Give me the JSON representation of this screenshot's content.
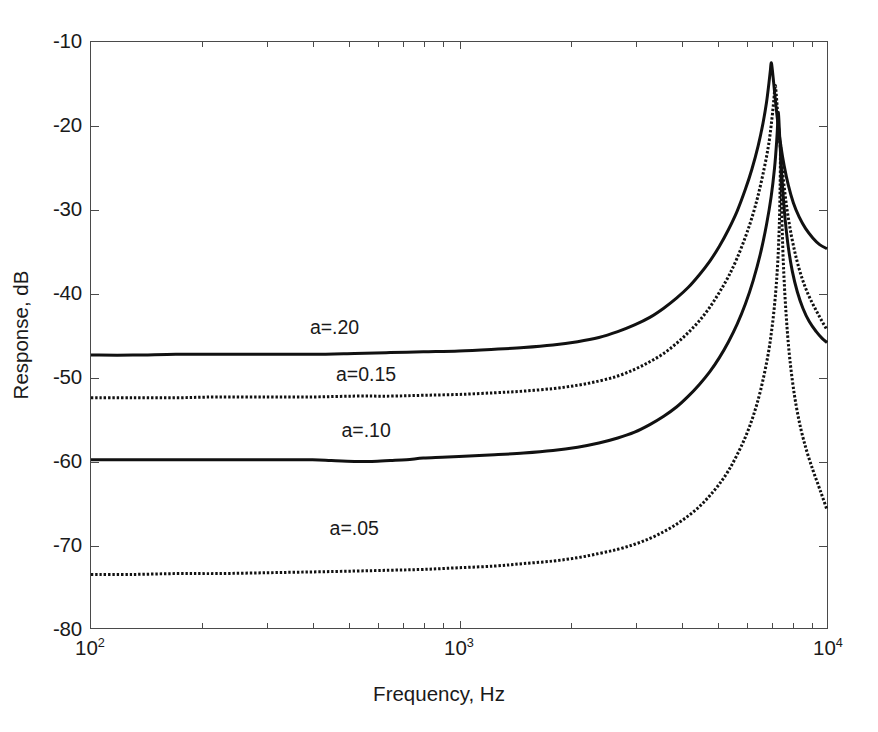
{
  "chart_data": {
    "type": "line",
    "title": "",
    "xlabel": "Frequency, Hz",
    "ylabel": "Response, dB",
    "xscale": "log",
    "yscale": "linear",
    "xlim": [
      100,
      10000
    ],
    "ylim": [
      -80,
      -10
    ],
    "grid": false,
    "legend_position": "inline-annotations",
    "xticks": [
      {
        "value": 100,
        "label": "10",
        "exponent": "2"
      },
      {
        "value": 1000,
        "label": "10",
        "exponent": "3"
      },
      {
        "value": 10000,
        "label": "10",
        "exponent": "4"
      }
    ],
    "yticks": [
      -10,
      -20,
      -30,
      -40,
      -50,
      -60,
      -70,
      -80
    ],
    "ytick_labels": [
      "-10",
      "-20",
      "-30",
      "-40",
      "-50",
      "-60",
      "-70",
      "-80"
    ],
    "series": [
      {
        "name": "a=.20",
        "annotation": "a=.20",
        "annotation_x": 460,
        "annotation_y": -44.0,
        "style": "solid",
        "color": "#111111",
        "width": 3.0,
        "baseline_db": -47.4,
        "peak_freq": 7050,
        "peak_db": -12.5,
        "end_db": -34.7,
        "points": [
          [
            100,
            -47.4
          ],
          [
            130,
            -47.4
          ],
          [
            170,
            -47.3
          ],
          [
            220,
            -47.3
          ],
          [
            300,
            -47.3
          ],
          [
            400,
            -47.3
          ],
          [
            520,
            -47.2
          ],
          [
            650,
            -47.1
          ],
          [
            800,
            -47.0
          ],
          [
            1000,
            -46.9
          ],
          [
            1250,
            -46.7
          ],
          [
            1500,
            -46.5
          ],
          [
            1800,
            -46.2
          ],
          [
            2100,
            -45.8
          ],
          [
            2400,
            -45.3
          ],
          [
            2700,
            -44.6
          ],
          [
            3000,
            -43.8
          ],
          [
            3300,
            -42.9
          ],
          [
            3600,
            -41.8
          ],
          [
            3900,
            -40.6
          ],
          [
            4200,
            -39.3
          ],
          [
            4500,
            -37.8
          ],
          [
            4800,
            -36.2
          ],
          [
            5100,
            -34.4
          ],
          [
            5400,
            -32.4
          ],
          [
            5700,
            -30.2
          ],
          [
            6000,
            -27.6
          ],
          [
            6250,
            -25.2
          ],
          [
            6500,
            -22.4
          ],
          [
            6700,
            -19.7
          ],
          [
            6850,
            -17.2
          ],
          [
            6950,
            -15.0
          ],
          [
            7020,
            -13.3
          ],
          [
            7050,
            -12.5
          ],
          [
            7090,
            -13.0
          ],
          [
            7160,
            -14.8
          ],
          [
            7250,
            -17.2
          ],
          [
            7350,
            -19.6
          ],
          [
            7480,
            -22.2
          ],
          [
            7650,
            -24.8
          ],
          [
            7850,
            -27.1
          ],
          [
            8100,
            -29.2
          ],
          [
            8400,
            -30.9
          ],
          [
            8750,
            -32.3
          ],
          [
            9150,
            -33.4
          ],
          [
            9550,
            -34.2
          ],
          [
            10000,
            -34.7
          ]
        ]
      },
      {
        "name": "a=0.15",
        "annotation": "a=0.15",
        "annotation_x": 560,
        "annotation_y": -49.7,
        "style": "dotted",
        "color": "#111111",
        "width": 3.0,
        "baseline_db": -52.5,
        "peak_freq": 7230,
        "peak_db": -15.2,
        "end_db": -44.4,
        "points": [
          [
            100,
            -52.5
          ],
          [
            130,
            -52.5
          ],
          [
            170,
            -52.5
          ],
          [
            220,
            -52.4
          ],
          [
            300,
            -52.4
          ],
          [
            400,
            -52.4
          ],
          [
            520,
            -52.3
          ],
          [
            650,
            -52.3
          ],
          [
            800,
            -52.2
          ],
          [
            1000,
            -52.1
          ],
          [
            1250,
            -51.9
          ],
          [
            1500,
            -51.7
          ],
          [
            1800,
            -51.4
          ],
          [
            2100,
            -51.0
          ],
          [
            2400,
            -50.5
          ],
          [
            2700,
            -49.9
          ],
          [
            3000,
            -49.1
          ],
          [
            3300,
            -48.2
          ],
          [
            3600,
            -47.2
          ],
          [
            3900,
            -46.0
          ],
          [
            4200,
            -44.7
          ],
          [
            4500,
            -43.3
          ],
          [
            4800,
            -41.7
          ],
          [
            5100,
            -39.9
          ],
          [
            5400,
            -38.0
          ],
          [
            5700,
            -35.8
          ],
          [
            6000,
            -33.3
          ],
          [
            6250,
            -31.0
          ],
          [
            6500,
            -28.3
          ],
          [
            6750,
            -25.1
          ],
          [
            6950,
            -22.1
          ],
          [
            7080,
            -19.3
          ],
          [
            7170,
            -16.9
          ],
          [
            7230,
            -15.2
          ],
          [
            7280,
            -16.3
          ],
          [
            7350,
            -18.8
          ],
          [
            7430,
            -21.5
          ],
          [
            7530,
            -24.4
          ],
          [
            7650,
            -27.3
          ],
          [
            7800,
            -30.2
          ],
          [
            8000,
            -33.1
          ],
          [
            8250,
            -35.8
          ],
          [
            8550,
            -38.2
          ],
          [
            8900,
            -40.2
          ],
          [
            9300,
            -41.9
          ],
          [
            9650,
            -43.2
          ],
          [
            10000,
            -44.4
          ]
        ]
      },
      {
        "name": "a=.10",
        "annotation": "a=.10",
        "annotation_x": 560,
        "annotation_y": -56.3,
        "style": "solid",
        "color": "#111111",
        "width": 3.0,
        "baseline_db": -59.9,
        "peak_freq": 7360,
        "peak_db": -18.4,
        "end_db": -45.9,
        "points": [
          [
            100,
            -59.9
          ],
          [
            130,
            -59.9
          ],
          [
            170,
            -59.9
          ],
          [
            220,
            -59.9
          ],
          [
            300,
            -59.9
          ],
          [
            400,
            -59.9
          ],
          [
            450,
            -60.0
          ],
          [
            520,
            -60.1
          ],
          [
            580,
            -60.1
          ],
          [
            650,
            -60.0
          ],
          [
            720,
            -59.9
          ],
          [
            800,
            -59.7
          ],
          [
            900,
            -59.6
          ],
          [
            1000,
            -59.5
          ],
          [
            1250,
            -59.3
          ],
          [
            1500,
            -59.1
          ],
          [
            1800,
            -58.8
          ],
          [
            2100,
            -58.4
          ],
          [
            2400,
            -57.9
          ],
          [
            2700,
            -57.3
          ],
          [
            3000,
            -56.6
          ],
          [
            3300,
            -55.7
          ],
          [
            3600,
            -54.7
          ],
          [
            3900,
            -53.6
          ],
          [
            4200,
            -52.3
          ],
          [
            4500,
            -50.9
          ],
          [
            4800,
            -49.4
          ],
          [
            5100,
            -47.7
          ],
          [
            5400,
            -45.8
          ],
          [
            5700,
            -43.7
          ],
          [
            6000,
            -41.3
          ],
          [
            6300,
            -38.5
          ],
          [
            6600,
            -35.2
          ],
          [
            6850,
            -31.8
          ],
          [
            7050,
            -28.5
          ],
          [
            7200,
            -25.1
          ],
          [
            7300,
            -21.8
          ],
          [
            7350,
            -19.4
          ],
          [
            7370,
            -18.4
          ],
          [
            7400,
            -19.3
          ],
          [
            7450,
            -22.0
          ],
          [
            7520,
            -25.2
          ],
          [
            7600,
            -28.3
          ],
          [
            7700,
            -31.3
          ],
          [
            7850,
            -34.5
          ],
          [
            8050,
            -37.4
          ],
          [
            8300,
            -39.8
          ],
          [
            8600,
            -41.8
          ],
          [
            8950,
            -43.4
          ],
          [
            9350,
            -44.6
          ],
          [
            9700,
            -45.4
          ],
          [
            10000,
            -45.9
          ]
        ]
      },
      {
        "name": "a=.05",
        "annotation": "a=.05",
        "annotation_x": 520,
        "annotation_y": -68.0,
        "style": "dotted",
        "color": "#111111",
        "width": 3.0,
        "baseline_db": -73.6,
        "peak_freq": 7480,
        "peak_db": -22.3,
        "end_db": -65.9,
        "points": [
          [
            100,
            -73.6
          ],
          [
            130,
            -73.6
          ],
          [
            170,
            -73.5
          ],
          [
            220,
            -73.5
          ],
          [
            300,
            -73.4
          ],
          [
            400,
            -73.3
          ],
          [
            520,
            -73.2
          ],
          [
            650,
            -73.1
          ],
          [
            800,
            -73.0
          ],
          [
            1000,
            -72.8
          ],
          [
            1250,
            -72.6
          ],
          [
            1500,
            -72.3
          ],
          [
            1800,
            -72.0
          ],
          [
            2100,
            -71.6
          ],
          [
            2400,
            -71.1
          ],
          [
            2700,
            -70.6
          ],
          [
            3000,
            -70.0
          ],
          [
            3300,
            -69.3
          ],
          [
            3600,
            -68.5
          ],
          [
            3900,
            -67.6
          ],
          [
            4200,
            -66.6
          ],
          [
            4500,
            -65.5
          ],
          [
            4800,
            -64.2
          ],
          [
            5100,
            -62.8
          ],
          [
            5400,
            -61.2
          ],
          [
            5700,
            -59.3
          ],
          [
            6000,
            -57.2
          ],
          [
            6300,
            -54.7
          ],
          [
            6600,
            -51.6
          ],
          [
            6900,
            -47.6
          ],
          [
            7100,
            -43.9
          ],
          [
            7250,
            -40.0
          ],
          [
            7350,
            -36.2
          ],
          [
            7420,
            -31.9
          ],
          [
            7460,
            -27.0
          ],
          [
            7480,
            -22.3
          ],
          [
            7500,
            -25.5
          ],
          [
            7530,
            -30.0
          ],
          [
            7580,
            -34.4
          ],
          [
            7650,
            -38.6
          ],
          [
            7750,
            -42.8
          ],
          [
            7880,
            -46.8
          ],
          [
            8050,
            -50.4
          ],
          [
            8250,
            -53.5
          ],
          [
            8500,
            -56.3
          ],
          [
            8800,
            -58.8
          ],
          [
            9150,
            -61.1
          ],
          [
            9500,
            -63.1
          ],
          [
            9750,
            -64.5
          ],
          [
            10000,
            -65.9
          ]
        ]
      }
    ]
  },
  "axis": {
    "x_title": "Frequency, Hz",
    "y_title": "Response, dB"
  }
}
